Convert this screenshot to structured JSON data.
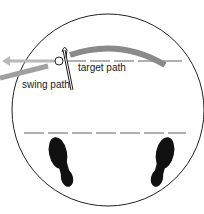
{
  "diagram": {
    "labels": {
      "target_path": "target path",
      "swing_path": "swing path"
    },
    "elements": [
      "circle-boundary",
      "target-line-dashed",
      "swing-arc",
      "arrow-left",
      "golf-ball",
      "golf-club",
      "foot-line-dashed",
      "left-footprint",
      "right-footprint"
    ],
    "colors": {
      "outline": "#222222",
      "swing_arc": "#8a8a8a",
      "dashed_line": "#b0b0b0",
      "footprint": "#111111"
    }
  }
}
